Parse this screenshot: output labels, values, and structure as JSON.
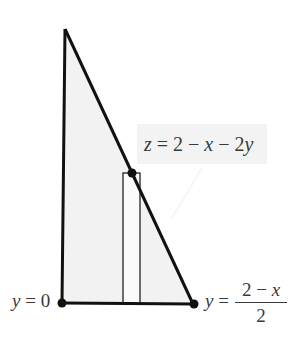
{
  "diagram": {
    "type": "cross-section",
    "colors": {
      "fill": "#f2f2f2",
      "stroke": "#111111",
      "text": "#3a3a3a",
      "label_background": "#f3f3f3"
    },
    "labels": {
      "surface": {
        "z": "z",
        "eq": " = 2 − ",
        "x": "x",
        "minus": " − 2",
        "y": "y"
      },
      "left_bound": {
        "var": "y",
        "rest": " = 0"
      },
      "right_bound": {
        "var": "y",
        "eq": " = ",
        "numerator_a": "2 − ",
        "numerator_x": "x",
        "denominator": "2"
      }
    },
    "points": [
      {
        "name": "y=0 endpoint"
      },
      {
        "name": "y=(2-x)/2 endpoint"
      },
      {
        "name": "surface point on hypotenuse"
      }
    ]
  }
}
